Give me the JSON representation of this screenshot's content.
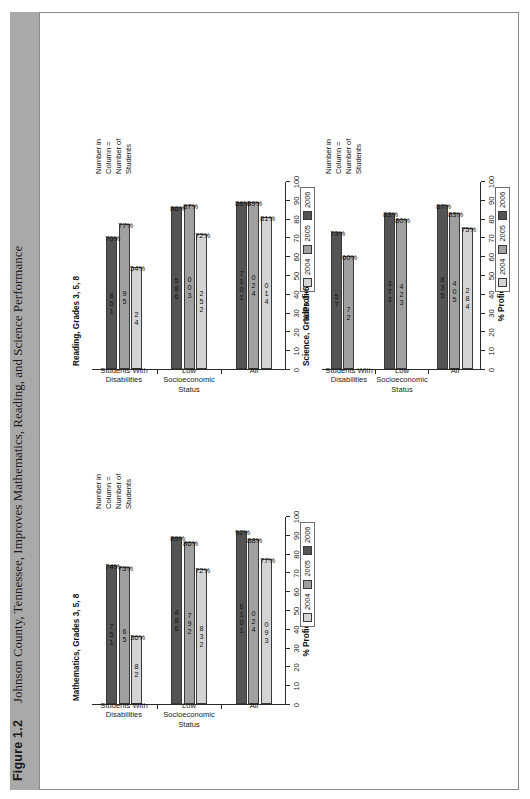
{
  "figure": {
    "label": "Figure 1.2",
    "title": "Johnson County, Tennessee, Improves Mathematics, Reading, and Science Performance"
  },
  "legend": {
    "items": [
      {
        "label": "2004",
        "color": "#d4d4d4"
      },
      {
        "label": "2005",
        "color": "#a0a0a0"
      },
      {
        "label": "2006",
        "color": "#545454"
      }
    ]
  },
  "note": "Number in\nColumn =\nNumber of\nStudents",
  "axis": {
    "ylabel": "% Proficient and Above",
    "ticks": [
      "0",
      "10",
      "20",
      "30",
      "40",
      "50",
      "60",
      "70",
      "80",
      "90",
      "100"
    ]
  },
  "groups": [
    "All",
    "Low Socioeconomic Status",
    "Students With Disabilities"
  ],
  "chart_data": [
    {
      "type": "bar",
      "title": "Mathematics, Grades 3, 5, 8",
      "ylabel": "% Proficient and Above",
      "xlabel": "",
      "ylim": [
        0,
        100
      ],
      "grid": false,
      "legend_position": "bottom-right",
      "categories": [
        "All",
        "Low Socioeconomic Status",
        "Students With Disabilities"
      ],
      "series": [
        {
          "name": "2004",
          "values": [
            77,
            72,
            36
          ],
          "labels": [
            "77%",
            "72%",
            "36%"
          ],
          "counts": [
            "390",
            "238",
            "28"
          ]
        },
        {
          "name": "2005",
          "values": [
            88,
            86,
            73
          ],
          "labels": [
            "88%",
            "86%",
            "73%"
          ],
          "counts": [
            "420",
            "297",
            "56"
          ]
        },
        {
          "name": "2006",
          "values": [
            92,
            89,
            74
          ],
          "labels": [
            "92%",
            "89%",
            "74%"
          ],
          "counts": [
            "1016",
            "684",
            "157"
          ]
        }
      ]
    },
    {
      "type": "bar",
      "title": "Reading, Grades 3, 5, 8",
      "ylabel": "% Proficient and Above",
      "xlabel": "",
      "ylim": [
        0,
        100
      ],
      "grid": false,
      "legend_position": "bottom-right",
      "categories": [
        "All",
        "Low Socioeconomic Status",
        "Students With Disabilities"
      ],
      "series": [
        {
          "name": "2004",
          "values": [
            81,
            72,
            54
          ],
          "labels": [
            "81%",
            "72%",
            "54%"
          ],
          "counts": [
            "410",
            "252",
            "42"
          ]
        },
        {
          "name": "2005",
          "values": [
            89,
            87,
            77
          ],
          "labels": [
            "89%",
            "87%",
            "77%"
          ],
          "counts": [
            "420",
            "300",
            "59"
          ]
        },
        {
          "name": "2006",
          "values": [
            89,
            86,
            70
          ],
          "labels": [
            "89%",
            "86%",
            "70%"
          ],
          "counts": [
            "1017",
            "685",
            "158"
          ]
        }
      ]
    },
    {
      "type": "bar",
      "title": "Science, Grades 3–6",
      "ylabel": "% Proficient and Above",
      "xlabel": "",
      "ylim": [
        0,
        100
      ],
      "grid": false,
      "legend_position": "bottom-right",
      "categories": [
        "All",
        "Low Socioeconomic Status",
        "Students With Disabilities"
      ],
      "series": [
        {
          "name": "2004",
          "values": [
            75,
            null,
            null
          ],
          "labels": [
            "75%",
            "",
            ""
          ],
          "counts": [
            "482",
            "",
            ""
          ]
        },
        {
          "name": "2005",
          "values": [
            83,
            80,
            60
          ],
          "labels": [
            "83%",
            "80%",
            "60%"
          ],
          "counts": [
            "504",
            "324",
            "27"
          ]
        },
        {
          "name": "2006",
          "values": [
            87,
            83,
            73
          ],
          "labels": [
            "87%",
            "83%",
            "73%"
          ],
          "counts": [
            "538",
            "373",
            "75"
          ]
        }
      ]
    }
  ]
}
